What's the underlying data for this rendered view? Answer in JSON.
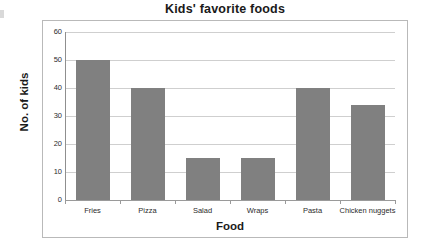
{
  "chart_data": {
    "type": "bar",
    "title": "Kids' favorite foods",
    "xlabel": "Food",
    "ylabel": "No. of kids",
    "categories": [
      "Fries",
      "Pizza",
      "Salad",
      "Wraps",
      "Pasta",
      "Chicken nuggets"
    ],
    "values": [
      50,
      40,
      15,
      15,
      40,
      34
    ],
    "ylim": [
      0,
      60
    ],
    "ytick_labels": [
      "60",
      "50",
      "40",
      "30",
      "20",
      "10",
      "0"
    ],
    "ytick_values": [
      60,
      50,
      40,
      30,
      20,
      10,
      0
    ],
    "grid": true,
    "legend": false,
    "bar_color": "#808080",
    "gridline_color": "#cfcfcf",
    "axis_color": "#8f8f8f",
    "frame_color": "#b9b9b9",
    "text_color": "#1a1a1a"
  }
}
